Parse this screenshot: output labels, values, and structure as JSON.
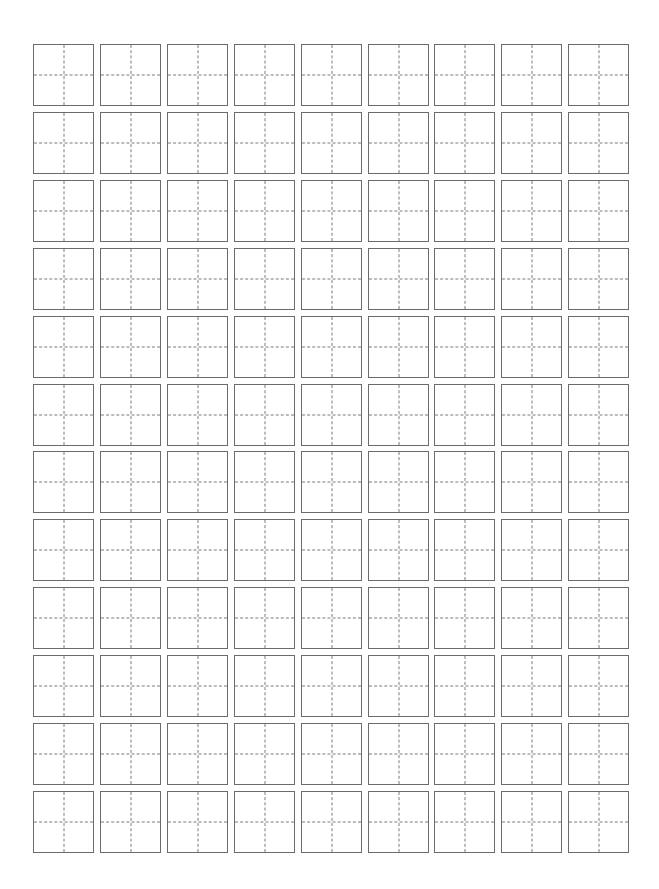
{
  "sheet": {
    "type": "tianzige-practice-grid",
    "rows": 12,
    "columns": 9,
    "cell_width_px": 61,
    "cell_height_px": 62,
    "origin_x_px": 33,
    "origin_y_px": 44,
    "column_pitch_px": 66.9,
    "row_pitch_px": 67.9,
    "border_color": "#6b6b6b",
    "guide_line_color": "#7a7a7a",
    "guide_line_style": "dashed",
    "background_color": "#ffffff",
    "cell_contents": []
  }
}
